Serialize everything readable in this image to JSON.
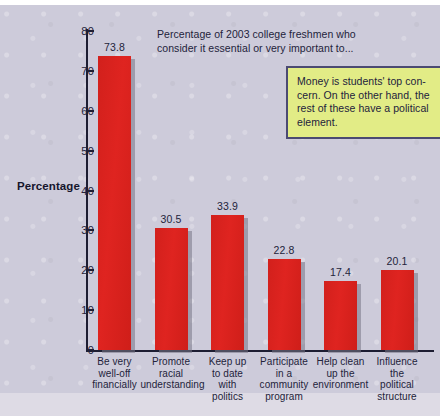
{
  "chart_data": {
    "type": "bar",
    "title": "Percentage of 2003 college freshmen who consider it essential or very important to...",
    "xlabel": "",
    "ylabel": "Percentage",
    "ylim": [
      0,
      80
    ],
    "ytick_step": 10,
    "grid": false,
    "legend": "none",
    "bar_color": "#d8221c",
    "categories": [
      "Be very well-off financially",
      "Promote racial understanding",
      "Keep up to date with politics",
      "Participate in a community program",
      "Help clean up the environment",
      "Influence the political structure"
    ],
    "values": [
      73.8,
      30.5,
      33.9,
      22.8,
      17.4,
      20.1
    ],
    "yticks": [
      "0",
      "10",
      "20",
      "30",
      "40",
      "50",
      "60",
      "70",
      "80"
    ],
    "annotations": [
      "Money is students' top concern. On the other hand, the rest of these have a political element."
    ]
  },
  "chart": {
    "title_line1": "Percentage of 2003 college freshmen who",
    "title_line2": "consider it essential or very important to...",
    "y_axis_title": "Percentage",
    "yticks": [
      "80",
      "70",
      "60",
      "50",
      "40",
      "30",
      "20",
      "10",
      "0"
    ],
    "bars": [
      {
        "value_label": "73.8",
        "cat_line1": "Be very",
        "cat_line2": "well-off",
        "cat_line3": "financially",
        "cat_line4": ""
      },
      {
        "value_label": "30.5",
        "cat_line1": "Promote",
        "cat_line2": "racial",
        "cat_line3": "understanding",
        "cat_line4": ""
      },
      {
        "value_label": "33.9",
        "cat_line1": "Keep up",
        "cat_line2": "to date",
        "cat_line3": "with",
        "cat_line4": "politics"
      },
      {
        "value_label": "22.8",
        "cat_line1": "Participate",
        "cat_line2": "in a",
        "cat_line3": "community",
        "cat_line4": "program"
      },
      {
        "value_label": "17.4",
        "cat_line1": "Help clean",
        "cat_line2": "up the",
        "cat_line3": "environment",
        "cat_line4": ""
      },
      {
        "value_label": "20.1",
        "cat_line1": "Influence",
        "cat_line2": "the",
        "cat_line3": "political",
        "cat_line4": "structure"
      }
    ]
  },
  "callout": {
    "line1": "Money is students' top con-",
    "line2": "cern. On the other hand, the",
    "line3": "rest of these have a political",
    "line4": "element.",
    "background_color": "#e2ec86",
    "border_color": "#4b4a72"
  },
  "colors": {
    "panel": "#cdcbda",
    "panel_foot": "#dedbe5",
    "bar": "#d8221c",
    "axis": "#1d1d32",
    "text": "#23233a"
  }
}
